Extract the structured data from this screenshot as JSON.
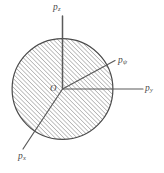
{
  "figure": {
    "type": "vector-axes-diagram",
    "background_color": "#ffffff",
    "circle": {
      "center_x": 62.5,
      "center_y": 89,
      "radius": 51,
      "stroke_color": "#4a4a4a",
      "stroke_width": 1.1,
      "hatch_color": "#8c8c8c",
      "hatch_angle_deg": 45,
      "hatch_spacing": 3.1
    },
    "origin": {
      "label": "O",
      "x": 62.5,
      "y": 89
    },
    "axes": [
      {
        "name": "p-z-axis",
        "label_base": "p",
        "label_sub": "z",
        "tip_x": 62.5,
        "tip_y": 16,
        "stroke_color": "#5a5a5a"
      },
      {
        "name": "p-psi-axis",
        "label_base": "p",
        "label_sub": "ψ",
        "tip_x": 116,
        "tip_y": 60,
        "stroke_color": "#5a5a5a"
      },
      {
        "name": "p-y-axis",
        "label_base": "p",
        "label_sub": "y",
        "tip_x": 143,
        "tip_y": 89,
        "stroke_color": "#5a5a5a"
      },
      {
        "name": "p-x-axis",
        "label_base": "p",
        "label_sub": "x",
        "tip_x": 22,
        "tip_y": 150,
        "stroke_color": "#5a5a5a"
      }
    ]
  }
}
